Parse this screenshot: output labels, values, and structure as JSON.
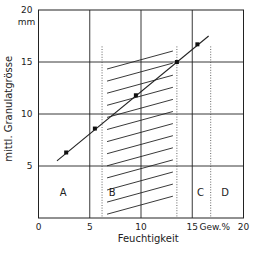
{
  "chart_data": {
    "type": "line",
    "title": "",
    "xlabel": "Feuchtigkeit",
    "ylabel": "mittl. Granulatgrösse",
    "x_unit_label": "Gew.%",
    "y_unit_label": "mm",
    "xlim": [
      0,
      20
    ],
    "ylim": [
      0,
      20
    ],
    "x_ticks": [
      0,
      5,
      10,
      15,
      20
    ],
    "y_ticks": [
      5,
      10,
      15,
      20
    ],
    "x_tick_labels": [
      "0",
      "5",
      "10",
      "15",
      "20"
    ],
    "y_tick_labels": [
      "5",
      "10",
      "15",
      "20"
    ],
    "grid": true,
    "series": [
      {
        "name": "Granulatgrösse",
        "points": [
          {
            "x": 2.7,
            "y": 6.3
          },
          {
            "x": 5.5,
            "y": 8.6
          },
          {
            "x": 9.5,
            "y": 11.8
          },
          {
            "x": 13.5,
            "y": 15.0
          },
          {
            "x": 15.5,
            "y": 16.7
          }
        ],
        "line_from": {
          "x": 1.8,
          "y": 5.5
        },
        "line_to": {
          "x": 16.6,
          "y": 17.5
        }
      }
    ],
    "boundaries": [
      6.2,
      13.5,
      16.8
    ],
    "hatched_region": {
      "x_from": 6.2,
      "x_to": 13.5,
      "label": "B"
    },
    "regions": [
      {
        "label": "A",
        "x": 2.4,
        "y": 2.5
      },
      {
        "label": "B",
        "x": 7.2,
        "y": 2.5
      },
      {
        "label": "C",
        "x": 15.8,
        "y": 2.5
      },
      {
        "label": "D",
        "x": 18.2,
        "y": 2.5
      }
    ]
  }
}
